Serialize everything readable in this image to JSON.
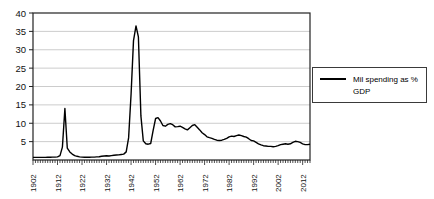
{
  "chart_data": {
    "type": "line",
    "title": "",
    "series": [
      {
        "name": "Mil spending as % GDP",
        "start_year": 1902,
        "end_year": 2015,
        "values": [
          0.7,
          0.7,
          0.7,
          0.7,
          0.7,
          0.7,
          0.75,
          0.75,
          0.8,
          0.8,
          0.85,
          1.2,
          3.5,
          14,
          3.2,
          2.2,
          1.6,
          1.2,
          1.0,
          0.85,
          0.8,
          0.75,
          0.75,
          0.75,
          0.8,
          0.8,
          0.85,
          0.9,
          1.0,
          1.1,
          1.15,
          1.1,
          1.2,
          1.3,
          1.35,
          1.4,
          1.5,
          1.6,
          2.2,
          6.0,
          18.0,
          32.5,
          36.5,
          33.5,
          12.0,
          5.2,
          4.4,
          4.3,
          4.5,
          8.0,
          11.3,
          11.5,
          10.6,
          9.4,
          9.2,
          9.7,
          9.9,
          9.6,
          9.0,
          9.1,
          9.2,
          8.9,
          8.5,
          8.2,
          8.8,
          9.4,
          9.6,
          8.9,
          8.2,
          7.4,
          6.9,
          6.3,
          6.1,
          5.9,
          5.6,
          5.4,
          5.3,
          5.4,
          5.6,
          5.9,
          6.3,
          6.5,
          6.4,
          6.6,
          6.8,
          6.6,
          6.4,
          6.2,
          5.8,
          5.3,
          5.2,
          4.8,
          4.4,
          4.1,
          3.9,
          3.8,
          3.7,
          3.7,
          3.6,
          3.7,
          3.9,
          4.2,
          4.3,
          4.4,
          4.3,
          4.4,
          4.8,
          5.1,
          5.0,
          4.8,
          4.4,
          4.2,
          4.2,
          4.3
        ]
      }
    ],
    "x_axis": {
      "tick_labels": [
        "1902",
        "1912",
        "1922",
        "1932",
        "1942",
        "1952",
        "1962",
        "1972",
        "1982",
        "1992",
        "2002",
        "2012"
      ],
      "minor_ticks": "yearly",
      "label_rotation_deg": -90
    },
    "y_axis": {
      "min": 0,
      "max": 40,
      "tick_step": 5,
      "tick_labels": [
        "40",
        "35",
        "30",
        "25",
        "20",
        "15",
        "10",
        "5"
      ]
    },
    "legend": {
      "position": "right",
      "label": "Mil spending as %\nGDP"
    },
    "grid": "horizontal",
    "colors": {
      "line": "#000000",
      "grid": "#cccccc",
      "axis": "#222222",
      "background": "#ffffff"
    }
  }
}
